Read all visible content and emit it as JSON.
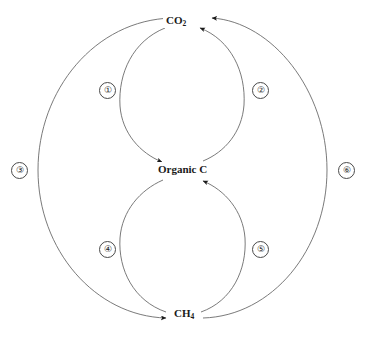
{
  "diagram": {
    "background_color": "#ffffff",
    "line_color": "#6b6b6b",
    "text_color": "#1a1a1a",
    "nodes": [
      {
        "id": "co2",
        "label_main": "CO",
        "label_sub": "2",
        "position": "top"
      },
      {
        "id": "organic-c",
        "label_main": "Organic C",
        "label_sub": "",
        "position": "center"
      },
      {
        "id": "ch4",
        "label_main": "CH",
        "label_sub": "4",
        "position": "bottom"
      }
    ],
    "steps": [
      {
        "id": "step-1",
        "label": "①",
        "number": "1",
        "from": "CO2",
        "to": "Organic C",
        "side": "left",
        "region": "upper"
      },
      {
        "id": "step-2",
        "label": "②",
        "number": "2",
        "from": "Organic C",
        "to": "CO2",
        "side": "right",
        "region": "upper"
      },
      {
        "id": "step-3",
        "label": "③",
        "number": "3",
        "from": "CO2",
        "to": "CH4",
        "side": "left",
        "region": "outer"
      },
      {
        "id": "step-4",
        "label": "④",
        "number": "4",
        "from": "Organic C",
        "to": "CH4",
        "side": "left",
        "region": "lower"
      },
      {
        "id": "step-5",
        "label": "⑤",
        "number": "5",
        "from": "CH4",
        "to": "Organic C",
        "side": "right",
        "region": "lower"
      },
      {
        "id": "step-6",
        "label": "⑥",
        "number": "6",
        "from": "CH4",
        "to": "CO2",
        "side": "right",
        "region": "outer"
      }
    ]
  }
}
